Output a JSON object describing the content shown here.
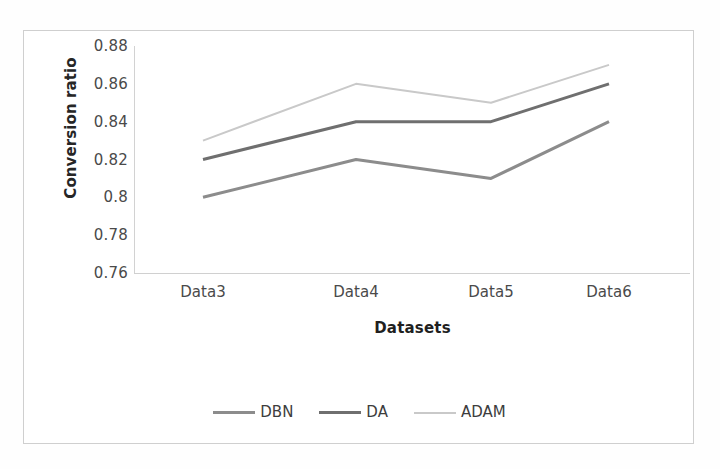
{
  "chart_data": {
    "type": "line",
    "title": "",
    "xlabel": "Datasets",
    "ylabel": "Conversion ratio",
    "categories": [
      "Data3",
      "Data4",
      "Data5",
      "Data6"
    ],
    "ylim": [
      0.76,
      0.88
    ],
    "ytick_labels": [
      "0.88",
      "0.86",
      "0.84",
      "0.82",
      "0.8",
      "0.78",
      "0.76"
    ],
    "ytick_values": [
      0.88,
      0.86,
      0.84,
      0.82,
      0.8,
      0.78,
      0.76
    ],
    "grid": false,
    "legend_position": "bottom-center",
    "series": [
      {
        "name": "DBN",
        "values": [
          0.8,
          0.82,
          0.81,
          0.84
        ],
        "color": "#8c8c8c",
        "width": 3.0
      },
      {
        "name": "DA",
        "values": [
          0.82,
          0.84,
          0.84,
          0.86
        ],
        "color": "#6f6f6f",
        "width": 3.0
      },
      {
        "name": "ADAM",
        "values": [
          0.83,
          0.86,
          0.85,
          0.87
        ],
        "color": "#c9c9c9",
        "width": 2.0
      }
    ]
  },
  "axis": {
    "y_title": "Conversion ratio",
    "x_title": "Datasets"
  },
  "legend": {
    "items": [
      {
        "label": "DBN"
      },
      {
        "label": "DA"
      },
      {
        "label": "ADAM"
      }
    ]
  },
  "caption": {
    "text": ""
  }
}
